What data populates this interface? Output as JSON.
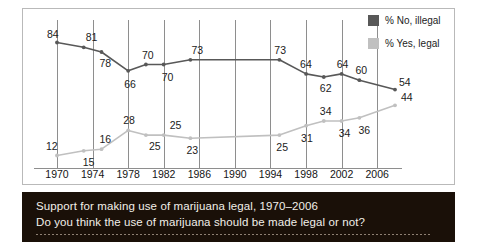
{
  "caption": {
    "title": "Support for making use of marijuana legal, 1970–2006",
    "question": "Do you think the use of marijuana should be made legal or not?"
  },
  "legend": {
    "position": "top-right",
    "items": [
      {
        "label": "% No, illegal",
        "color": "#585858"
      },
      {
        "label": "% Yes, legal",
        "color": "#c0c0c0"
      }
    ]
  },
  "axis": {
    "x_ticks": [
      "1970",
      "1974",
      "1978",
      "1982",
      "1986",
      "1990",
      "1994",
      "1998",
      "2002",
      "2006"
    ]
  },
  "chart_data": {
    "type": "line",
    "title": "Support for making use of marijuana legal, 1970–2006",
    "subtitle": "Do you think the use of marijuana should be made legal or not?",
    "xlabel": "",
    "ylabel": "",
    "ylim": [
      0,
      100
    ],
    "xlim": [
      1969,
      2009
    ],
    "grid": "vertical-only",
    "legend_position": "top-right",
    "x": [
      1970,
      1973,
      1975,
      1978,
      1980,
      1982,
      1985,
      1995,
      1998,
      2000,
      2002,
      2004,
      2008
    ],
    "categories": [
      "1970",
      "1973",
      "1975",
      "1978",
      "1980",
      "1982",
      "1985",
      "1995",
      "1998",
      "2000",
      "2002",
      "2004",
      "2008"
    ],
    "series": [
      {
        "name": "% No, illegal",
        "color": "#585858",
        "values": [
          84,
          81,
          78,
          66,
          70,
          70,
          73,
          73,
          64,
          62,
          64,
          60,
          54
        ],
        "labels": [
          "84",
          "81",
          "78",
          "66",
          "70",
          "70",
          "73",
          "73",
          "64",
          "62",
          "64",
          "60",
          "54"
        ]
      },
      {
        "name": "% Yes, legal",
        "color": "#c0c0c0",
        "values": [
          12,
          15,
          16,
          28,
          25,
          25,
          23,
          25,
          31,
          34,
          34,
          36,
          44
        ],
        "labels": [
          "12",
          "15",
          "16",
          "28",
          "25",
          "25",
          "23",
          "25",
          "31",
          "34",
          "34",
          "36",
          "44"
        ]
      }
    ]
  }
}
